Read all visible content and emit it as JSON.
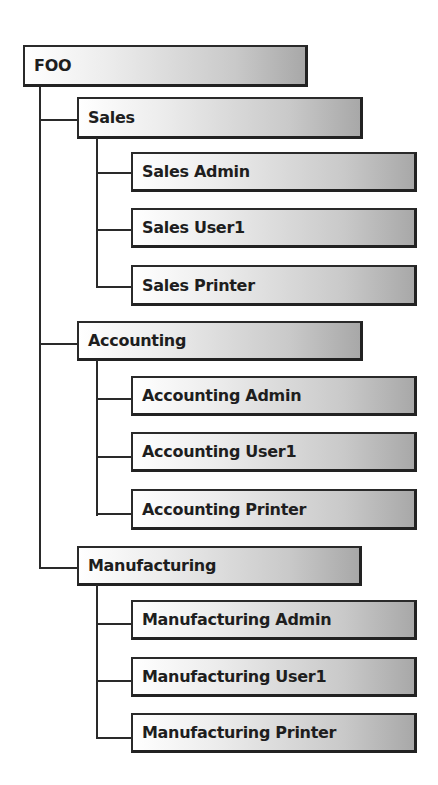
{
  "diagram": {
    "type": "org-tree",
    "root": {
      "label": "FOO",
      "children": [
        {
          "label": "Sales",
          "children": [
            {
              "label": "Sales Admin"
            },
            {
              "label": "Sales User1"
            },
            {
              "label": "Sales Printer"
            }
          ]
        },
        {
          "label": "Accounting",
          "children": [
            {
              "label": "Accounting Admin"
            },
            {
              "label": "Accounting User1"
            },
            {
              "label": "Accounting Printer"
            }
          ]
        },
        {
          "label": "Manufacturing",
          "children": [
            {
              "label": "Manufacturing Admin"
            },
            {
              "label": "Manufacturing User1"
            },
            {
              "label": "Manufacturing Printer"
            }
          ]
        }
      ]
    }
  },
  "colors": {
    "border": "#2a2a2a",
    "text": "#1e1e1e",
    "gradient_start": "#ffffff",
    "gradient_end": "#a8a8a8",
    "background": "#ffffff"
  }
}
